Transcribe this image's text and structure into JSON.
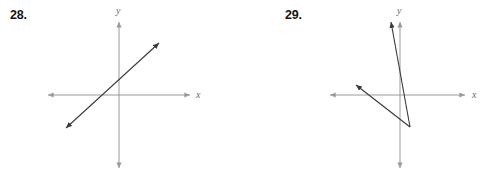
{
  "background_color": "#ffffff",
  "axis_color": "#9a9a9a",
  "line_color": "#3a3a3a",
  "label_color": "#6b6b6b",
  "problems": [
    {
      "number_label": "28.",
      "axes": {
        "x_axis_label": "x",
        "y_axis_label": "y",
        "x_axis": {
          "x1": 48,
          "y1": 95,
          "x2": 190,
          "y2": 95,
          "arrows": "both"
        },
        "y_axis": {
          "x1": 119,
          "y1": 22,
          "x2": 119,
          "y2": 168,
          "arrows": "both"
        },
        "origin": {
          "x": 119,
          "y": 95
        },
        "x_label_pos": {
          "x": 196,
          "y": 98
        },
        "y_label_pos": {
          "x": 116,
          "y": 14
        }
      },
      "graphed_lines": [
        {
          "name": "line-1",
          "x1": 66,
          "y1": 128,
          "x2": 159,
          "y2": 43,
          "arrows": "both",
          "description": "single line with positive slope passing through the origin region"
        }
      ]
    },
    {
      "number_label": "29.",
      "axes": {
        "x_axis_label": "x",
        "y_axis_label": "y",
        "x_axis": {
          "x1": 86,
          "y1": 95,
          "x2": 221,
          "y2": 95,
          "arrows": "both"
        },
        "y_axis": {
          "x1": 156,
          "y1": 22,
          "x2": 156,
          "y2": 168,
          "arrows": "both"
        },
        "origin": {
          "x": 156,
          "y": 95
        },
        "x_label_pos": {
          "x": 228,
          "y": 98
        },
        "y_label_pos": {
          "x": 153,
          "y": 14
        }
      },
      "graphed_lines": [
        {
          "name": "line-1",
          "x1": 147,
          "y1": 22,
          "x2": 166,
          "y2": 127,
          "arrows": "start",
          "description": "steep line with large negative slope from upper left to lower right"
        },
        {
          "name": "line-2",
          "x1": 112,
          "y1": 85,
          "x2": 166,
          "y2": 127,
          "arrows": "start",
          "description": "shallow line with negative slope meeting line 1 at lower right"
        }
      ]
    }
  ]
}
